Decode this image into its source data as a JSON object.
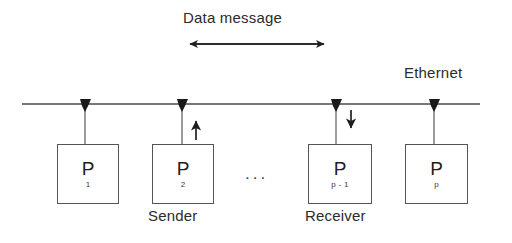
{
  "diagram": {
    "title": "Data message",
    "network_label": "Ethernet",
    "ellipsis": "...",
    "bus": {
      "y": 104,
      "x_start": 22,
      "x_end": 480,
      "color": "#4a4a4a"
    },
    "span_arrow": {
      "label": "Data message",
      "x_start": 182,
      "x_end": 332,
      "y": 44,
      "direction": "both"
    },
    "nodes": [
      {
        "id": "p1",
        "name": "P",
        "subscript": "1",
        "role": "",
        "x": 57,
        "y": 144,
        "width": 62,
        "height": 60,
        "tap_x": 85
      },
      {
        "id": "p2",
        "name": "P",
        "subscript": "2",
        "role": "Sender",
        "x": 152,
        "y": 144,
        "width": 62,
        "height": 60,
        "tap_x": 182
      },
      {
        "id": "pp1",
        "name": "P",
        "subscript": "p - 1",
        "role": "Receiver",
        "x": 308,
        "y": 144,
        "width": 64,
        "height": 60,
        "tap_x": 336
      },
      {
        "id": "pp",
        "name": "P",
        "subscript": "p",
        "role": "",
        "x": 405,
        "y": 144,
        "width": 63,
        "height": 60,
        "tap_x": 434
      }
    ],
    "flow_arrows": [
      {
        "id": "send-arrow",
        "direction": "up",
        "x": 196,
        "y_tail": 140,
        "y_head": 112
      },
      {
        "id": "receive-arrow",
        "direction": "down",
        "x": 351,
        "y_tail": 110,
        "y_head": 137
      }
    ],
    "colors": {
      "line": "#4a4a4a",
      "box_border": "#555555",
      "text": "#2b2b2b",
      "arrow": "#1f1f1f",
      "background": "#ffffff"
    }
  }
}
